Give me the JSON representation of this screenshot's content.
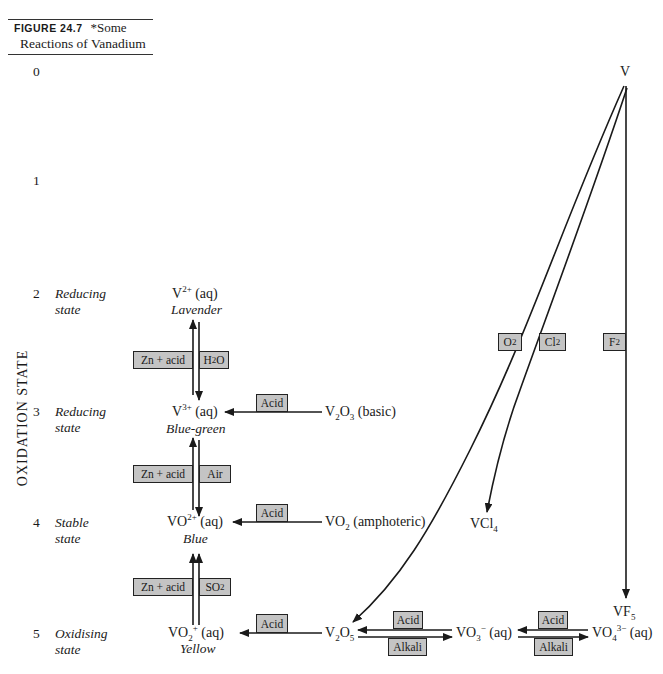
{
  "caption": {
    "figure_label": "FIGURE 24.7",
    "title_part1": "*Some",
    "title_part2": "Reactions of Vanadium"
  },
  "axis": {
    "title": "OXIDATION STATE",
    "levels": [
      {
        "value": "0",
        "desc1": "",
        "desc2": ""
      },
      {
        "value": "1",
        "desc1": "",
        "desc2": ""
      },
      {
        "value": "2",
        "desc1": "Reducing",
        "desc2": "state"
      },
      {
        "value": "3",
        "desc1": "Reducing",
        "desc2": "state"
      },
      {
        "value": "4",
        "desc1": "Stable",
        "desc2": "state"
      },
      {
        "value": "5",
        "desc1": "Oxidising",
        "desc2": "state"
      }
    ]
  },
  "species": {
    "V": "V",
    "V2": {
      "base": "V",
      "sup": "2+",
      "tail": " (aq)",
      "color": "Lavender"
    },
    "V3": {
      "base": "V",
      "sup": "3+",
      "tail": " (aq)",
      "color": "Blue-green"
    },
    "VO2p": {
      "base": "VO",
      "sup": "2+",
      "tail": " (aq)",
      "color": "Blue"
    },
    "VO2plus": {
      "base": "VO",
      "sub": "2",
      "sup": "+",
      "tail": " (aq)",
      "color": "Yellow"
    },
    "V2O3": {
      "a": "V",
      "s1": "2",
      "b": "O",
      "s2": "3",
      "tail": " (basic)"
    },
    "VO2": {
      "a": "VO",
      "s1": "2",
      "tail": " (amphoteric)"
    },
    "VCl4": {
      "a": "VCl",
      "s1": "4"
    },
    "VF5": {
      "a": "VF",
      "s1": "5"
    },
    "V2O5": {
      "a": "V",
      "s1": "2",
      "b": "O",
      "s2": "5"
    },
    "VO3": {
      "a": "VO",
      "s1": "3",
      "sup": "−",
      "tail": " (aq)"
    },
    "VO4": {
      "a": "VO",
      "s1": "4",
      "sup": "3−",
      "tail": " (aq)"
    }
  },
  "reagents": {
    "zn_acid_1": "Zn + acid",
    "h2o": {
      "a": "H",
      "s": "2",
      "b": "O"
    },
    "zn_acid_2": "Zn + acid",
    "air": "Air",
    "zn_acid_3": "Zn + acid",
    "so2": {
      "a": "SO",
      "s": "2"
    },
    "acid_v2o3": "Acid",
    "acid_vo2": "Acid",
    "acid_v2o5": "Acid",
    "o2": {
      "a": "O",
      "s": "2"
    },
    "cl2": {
      "a": "Cl",
      "s": "2"
    },
    "f2": {
      "a": "F",
      "s": "2"
    },
    "acid_vo3": "Acid",
    "alkali_vo3": "Alkali",
    "acid_vo4": "Acid",
    "alkali_vo4": "Alkali"
  },
  "colors": {
    "box_fill": "#c4c4c4",
    "line": "#1a1a1a"
  }
}
